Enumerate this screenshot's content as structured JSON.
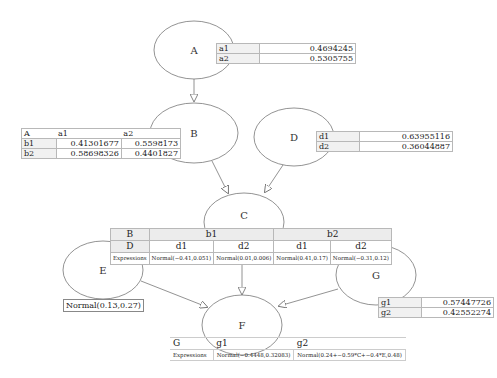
{
  "nodes": {
    "A": {
      "label": "A"
    },
    "B": {
      "label": "B"
    },
    "C": {
      "label": "C"
    },
    "D": {
      "label": "D"
    },
    "E": {
      "label": "E"
    },
    "F": {
      "label": "F"
    },
    "G": {
      "label": "G"
    }
  },
  "edges": [
    {
      "from": "A",
      "to": "B"
    },
    {
      "from": "B",
      "to": "C"
    },
    {
      "from": "D",
      "to": "C"
    },
    {
      "from": "C",
      "to": "F"
    },
    {
      "from": "E",
      "to": "F"
    },
    {
      "from": "G",
      "to": "F"
    }
  ],
  "table_A": {
    "rows": [
      {
        "state": "a1",
        "value": "0.4694245"
      },
      {
        "state": "a2",
        "value": "0.5305755"
      }
    ]
  },
  "table_B": {
    "header": {
      "parent": "A",
      "col1": "a1",
      "col2": "a2"
    },
    "rows": [
      {
        "state": "b1",
        "v1": "0.41301677",
        "v2": "0.5598173"
      },
      {
        "state": "b2",
        "v1": "0.58698326",
        "v2": "0.4401827"
      }
    ]
  },
  "table_D": {
    "rows": [
      {
        "state": "d1",
        "value": "0.63955116"
      },
      {
        "state": "d2",
        "value": "0.36044887"
      }
    ]
  },
  "table_C": {
    "row1": {
      "label": "B",
      "b1": "b1",
      "b2": "b2"
    },
    "row2": {
      "label": "D",
      "cols": [
        "d1",
        "d2",
        "d1",
        "d2"
      ]
    },
    "row3": {
      "label": "Expressions",
      "cols": [
        "Normal(−0.41,0.051)",
        "Normal(0.01,0.006)",
        "Normal(0.41,0.17)",
        "Normal(−0.31,0.12)"
      ]
    }
  },
  "table_E": {
    "expression": "Normal(0.13,0.27)"
  },
  "table_G": {
    "rows": [
      {
        "state": "g1",
        "value": "0.57447726"
      },
      {
        "state": "g2",
        "value": "0.42552274"
      }
    ]
  },
  "table_F": {
    "header": {
      "label": "G",
      "col1": "g1",
      "col2": "g2"
    },
    "expr_row": {
      "label": "Expressions",
      "col1": "Normal(−0.4448,0.32083)",
      "col2": "Normal(0.24+−0.59*C+−0.4*E,0.48)"
    }
  }
}
